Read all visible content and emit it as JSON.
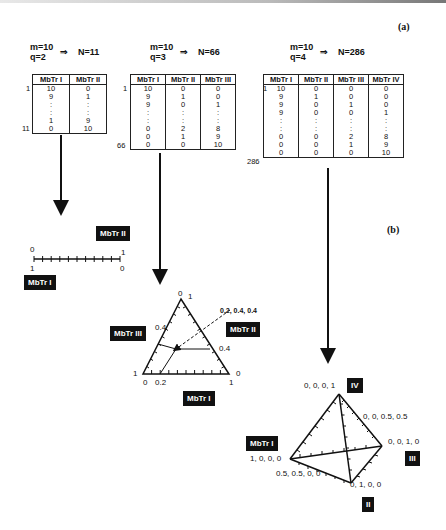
{
  "panels": {
    "a": "(a)",
    "b": "(b)"
  },
  "cases": [
    {
      "m": "m=10",
      "q": "q=2",
      "arrow": "⇒",
      "n": "N=11",
      "headers": [
        "MbTr I",
        "MbTr II"
      ],
      "rows": [
        [
          "10",
          "0"
        ],
        [
          "9",
          "1"
        ],
        [
          ":",
          ":"
        ],
        [
          ":",
          ":"
        ],
        [
          "1",
          "9"
        ],
        [
          "0",
          "10"
        ]
      ],
      "first_index": "1",
      "last_index": "11"
    },
    {
      "m": "m=10",
      "q": "q=3",
      "arrow": "⇒",
      "n": "N=66",
      "headers": [
        "MbTr I",
        "MbTr II",
        "MbTr III"
      ],
      "rows": [
        [
          "10",
          "0",
          "0"
        ],
        [
          "9",
          "1",
          "0"
        ],
        [
          "9",
          "0",
          "1"
        ],
        [
          ":",
          ":",
          ":"
        ],
        [
          ":",
          ":",
          ":"
        ],
        [
          "0",
          "2",
          "8"
        ],
        [
          "0",
          "1",
          "9"
        ],
        [
          "0",
          "0",
          "10"
        ]
      ],
      "first_index": "1",
      "last_index": "66"
    },
    {
      "m": "m=10",
      "q": "q=4",
      "arrow": "⇒",
      "n": "N=286",
      "headers": [
        "MbTr I",
        "MbTr II",
        "MbTr III",
        "MbTr IV"
      ],
      "rows": [
        [
          "10",
          "0",
          "0",
          "0"
        ],
        [
          "9",
          "1",
          "0",
          "0"
        ],
        [
          "9",
          "0",
          "1",
          "0"
        ],
        [
          "9",
          "0",
          "0",
          "1"
        ],
        [
          ":",
          ":",
          ":",
          ":"
        ],
        [
          ":",
          ":",
          ":",
          ":"
        ],
        [
          "0",
          "0",
          "2",
          "8"
        ],
        [
          "0",
          "0",
          "1",
          "9"
        ],
        [
          "0",
          "0",
          "0",
          "10"
        ]
      ],
      "first_index": "1",
      "last_index": "286"
    }
  ],
  "line_diagram": {
    "top_left": "0",
    "top_right": "1",
    "bottom_left": "1",
    "bottom_right": "0",
    "label_top": "MbTr II",
    "label_bottom": "MbTr I"
  },
  "triangle_diagram": {
    "apex_left": "0",
    "apex_right": "1",
    "left_mid": "0.4",
    "right_mid": "0.4",
    "left_bottom": "1",
    "right_bottom": "0",
    "base_left": "0",
    "base_tick": "0.2",
    "base_right": "1",
    "point_label": "0.2, 0.4, 0.4",
    "label_left": "MbTr III",
    "label_right": "MbTr II",
    "label_bottom": "MbTr I"
  },
  "tetra_diagram": {
    "apex": "0, 0, 0, 1",
    "apex_badge": "IV",
    "edge_mid": "0, 0, 0.5, 0.5",
    "right_vertex": "0, 0, 1, 0",
    "right_badge": "III",
    "left_vertex": "1, 0, 0, 0",
    "left_badge": "MbTr I",
    "bottom_mid": "0.5, 0.5, 0, 0",
    "bottom_vertex": "0, 1, 0, 0",
    "bottom_badge": "II"
  }
}
